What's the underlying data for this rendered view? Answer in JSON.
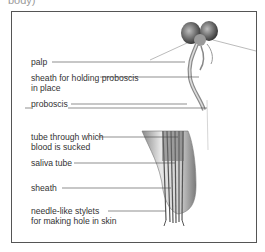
{
  "caption": "body)",
  "diagram": {
    "labels": {
      "palp": "palp",
      "sheath_holding_1": "sheath for holding proboscis",
      "sheath_holding_2": "in place",
      "proboscis": "proboscis",
      "tube_blood_1": "tube through which",
      "tube_blood_2": "blood is sucked",
      "saliva_tube": "saliva tube",
      "sheath": "sheath",
      "stylets_1": "needle-like stylets",
      "stylets_2": "for making hole in skin"
    },
    "colors": {
      "frame": "#555555",
      "leader": "#444444",
      "text": "#333333"
    }
  }
}
